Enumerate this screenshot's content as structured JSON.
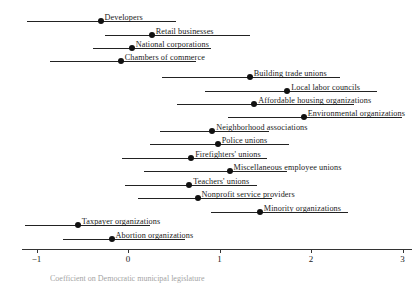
{
  "chart_data": {
    "type": "scatter",
    "title": "",
    "subtitle": "",
    "xlabel": "Coefficient on Democratic municipal legislature",
    "ylabel": "",
    "xlim": [
      -1.35,
      3.15
    ],
    "grid": false,
    "legend": null,
    "x_ticks": [
      "-1",
      "0",
      "1",
      "2",
      "3"
    ],
    "x_tick_values": [
      -1,
      0,
      1,
      2,
      3
    ],
    "categories": [
      "Developers",
      "Retail businesses",
      "National corporations",
      "Chambers of commerce",
      "Building trade unions",
      "Local labor councils",
      "Affordable housing organizations",
      "Environmental organizations",
      "Neighborhood associations",
      "Police unions",
      "Firefighters' unions",
      "Miscellaneous employee unions",
      "Teachers' unions",
      "Nonprofit service providers",
      "Minority organizations",
      "Taxpayer organizations",
      "Abortion organizations"
    ],
    "values": [
      -0.3,
      0.26,
      0.04,
      -0.08,
      1.33,
      1.74,
      1.38,
      1.92,
      0.92,
      0.98,
      0.69,
      1.11,
      0.67,
      0.76,
      1.44,
      -0.55,
      -0.18
    ],
    "ci_low": [
      -1.1,
      -0.25,
      -0.38,
      -0.85,
      0.37,
      0.84,
      0.54,
      1.09,
      0.35,
      0.24,
      -0.07,
      0.18,
      -0.03,
      0.11,
      0.91,
      -1.13,
      -0.71
    ],
    "ci_high": [
      0.53,
      1.33,
      0.91,
      0.74,
      2.32,
      2.72,
      2.47,
      3.0,
      1.54,
      1.76,
      1.52,
      1.74,
      1.41,
      1.57,
      2.4,
      0.24,
      0.62
    ],
    "label_align": [
      "right",
      "right",
      "right",
      "right",
      "right",
      "right",
      "right",
      "right",
      "right",
      "right",
      "right",
      "right",
      "right",
      "right",
      "right",
      "left",
      "right"
    ],
    "point_color": "#111111",
    "line_color": "#222222",
    "axis_color": "#333333",
    "background": "#ffffff",
    "rows": [
      {
        "label": "Developers",
        "value": -0.3,
        "ci_low": -1.1,
        "ci_high": 0.53,
        "y": 14
      },
      {
        "label": "Retail businesses",
        "value": 0.26,
        "ci_low": -0.25,
        "ci_high": 1.33,
        "y": 28
      },
      {
        "label": "National corporations",
        "value": 0.04,
        "ci_low": -0.38,
        "ci_high": 0.91,
        "y": 41
      },
      {
        "label": "Chambers of commerce",
        "value": -0.08,
        "ci_low": -0.85,
        "ci_high": 0.74,
        "y": 54
      },
      {
        "label": "Building trade unions",
        "value": 1.33,
        "ci_low": 0.37,
        "ci_high": 2.32,
        "y": 70
      },
      {
        "label": "Local labor councils",
        "value": 1.74,
        "ci_low": 0.84,
        "ci_high": 2.72,
        "y": 84
      },
      {
        "label": "Affordable housing organizations",
        "value": 1.38,
        "ci_low": 0.54,
        "ci_high": 2.47,
        "y": 97
      },
      {
        "label": "Environmental organizations",
        "value": 1.92,
        "ci_low": 1.09,
        "ci_high": 3.0,
        "y": 110
      },
      {
        "label": "Neighborhood associations",
        "value": 0.92,
        "ci_low": 0.35,
        "ci_high": 1.54,
        "y": 124
      },
      {
        "label": "Police unions",
        "value": 0.98,
        "ci_low": 0.24,
        "ci_high": 1.76,
        "y": 137
      },
      {
        "label": "Firefighters' unions",
        "value": 0.69,
        "ci_low": -0.07,
        "ci_high": 1.52,
        "y": 151
      },
      {
        "label": "Miscellaneous employee unions",
        "value": 1.11,
        "ci_low": 0.18,
        "ci_high": 1.74,
        "y": 164
      },
      {
        "label": "Teachers' unions",
        "value": 0.67,
        "ci_low": -0.03,
        "ci_high": 1.41,
        "y": 178
      },
      {
        "label": "Nonprofit service providers",
        "value": 0.76,
        "ci_low": 0.11,
        "ci_high": 1.57,
        "y": 191
      },
      {
        "label": "Minority organizations",
        "value": 1.44,
        "ci_low": 0.91,
        "ci_high": 2.4,
        "y": 205
      },
      {
        "label": "Taxpayer organizations",
        "value": -0.55,
        "ci_low": -1.13,
        "ci_high": 0.24,
        "y": 218
      },
      {
        "label": "Abortion organizations",
        "value": -0.18,
        "ci_low": -0.71,
        "ci_high": 0.62,
        "y": 232
      }
    ]
  },
  "axis": {
    "ticks": [
      {
        "label": "−1",
        "value": -1
      },
      {
        "label": "0",
        "value": 0
      },
      {
        "label": "1",
        "value": 1
      },
      {
        "label": "2",
        "value": 2
      },
      {
        "label": "3",
        "value": 3
      }
    ],
    "caption": "Coefficient on Democratic municipal legislature"
  }
}
